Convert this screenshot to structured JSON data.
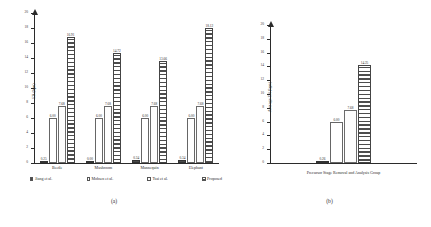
{
  "figure": {
    "panels": [
      {
        "caption": "(a)",
        "ylabel": "ER (bpn)",
        "xlabel": "",
        "yaxis": {
          "min": 0,
          "max": 20,
          "step": 2,
          "ticks": [
            "0",
            "2",
            "4",
            "6",
            "8",
            "10",
            "12",
            "14",
            "16",
            "18",
            "20"
          ]
        },
        "series_names": [
          "Jiang et al.",
          "Mohsen et al.",
          "Tsai et al.",
          "Proposed"
        ],
        "groups": [
          {
            "label": "Beetle",
            "values": [
              "0.25",
              "6.00",
              "7.68",
              "16.91"
            ]
          },
          {
            "label": "Mushroom",
            "values": [
              "0.00",
              "6.00",
              "7.68",
              "14.72"
            ]
          },
          {
            "label": "Mannequin",
            "values": [
              "0.34",
              "6.00",
              "7.68",
              "13.66"
            ]
          },
          {
            "label": "Elephant",
            "values": [
              "0.34",
              "6.00",
              "7.68",
              "18.12"
            ]
          }
        ]
      },
      {
        "caption": "(b)",
        "ylabel": "Average ER (bpn)",
        "xlabel": "Precursor Stage Removal and Analysis Group",
        "yaxis": {
          "min": 0,
          "max": 20,
          "step": 2,
          "ticks": [
            "0",
            "2",
            "4",
            "6",
            "8",
            "10",
            "12",
            "14",
            "16",
            "18",
            "20"
          ]
        },
        "series_names": [
          "Jiang et al.",
          "Mohsen et al.",
          "Tsai et al.",
          "Proposed"
        ],
        "groups": [
          {
            "label": "",
            "values": [
              "0.26",
              "6.00",
              "7.68",
              "14.25"
            ]
          }
        ]
      }
    ]
  },
  "chart_data": [
    {
      "type": "bar",
      "panel": "(a)",
      "title": "",
      "xlabel": "",
      "ylabel": "ER (bpn)",
      "ylim": [
        0,
        20
      ],
      "ytick_step": 2,
      "grid": false,
      "legend_position": "bottom",
      "categories": [
        "Beetle",
        "Mushroom",
        "Mannequin",
        "Elephant"
      ],
      "series": [
        {
          "name": "Jiang et al.",
          "values": [
            0.25,
            0.0,
            0.34,
            0.34
          ],
          "fill": "solid-dark"
        },
        {
          "name": "Mohsen et al.",
          "values": [
            6.0,
            6.0,
            6.0,
            6.0
          ],
          "fill": "white"
        },
        {
          "name": "Tsai et al.",
          "values": [
            7.68,
            7.68,
            7.68,
            7.68
          ],
          "fill": "white"
        },
        {
          "name": "Proposed",
          "values": [
            16.91,
            14.72,
            13.66,
            18.12
          ],
          "fill": "horizontal-hatch"
        }
      ],
      "data_labels": [
        [
          "0.25",
          "0.00",
          "0.34",
          "0.34"
        ],
        [
          "6.00",
          "6.00",
          "6.00",
          "6.00"
        ],
        [
          "7.68",
          "7.68",
          "7.68",
          "7.68"
        ],
        [
          "16.91",
          "14.72",
          "13.66",
          "18.12"
        ]
      ]
    },
    {
      "type": "bar",
      "panel": "(b)",
      "title": "",
      "xlabel": "Precursor Stage Removal and Analysis Group",
      "ylabel": "Average ER (bpn)",
      "ylim": [
        0,
        20
      ],
      "ytick_step": 2,
      "grid": false,
      "legend_position": "bottom",
      "categories": [
        "Precursor Stage Removal and Analysis Group"
      ],
      "series": [
        {
          "name": "Jiang et al.",
          "values": [
            0.26
          ],
          "fill": "solid-dark"
        },
        {
          "name": "Mohsen et al.",
          "values": [
            6.0
          ],
          "fill": "white"
        },
        {
          "name": "Tsai et al.",
          "values": [
            7.68
          ],
          "fill": "white"
        },
        {
          "name": "Proposed",
          "values": [
            14.25
          ],
          "fill": "horizontal-hatch"
        }
      ],
      "data_labels": [
        [
          "0.26"
        ],
        [
          "6.00"
        ],
        [
          "7.68"
        ],
        [
          "14.25"
        ]
      ]
    }
  ]
}
